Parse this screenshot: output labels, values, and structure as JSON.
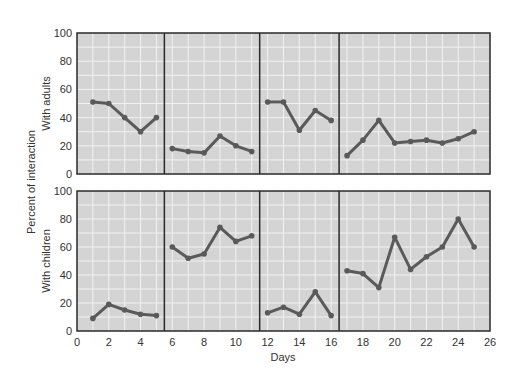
{
  "chart_data": {
    "type": "line",
    "xlabel": "Days",
    "ylabel": "Percent of interaction",
    "xlim": [
      0,
      26
    ],
    "xticks": [
      0,
      2,
      4,
      6,
      8,
      10,
      12,
      14,
      16,
      18,
      20,
      22,
      24,
      26
    ],
    "ylim": [
      0,
      100
    ],
    "yticks": [
      0,
      20,
      40,
      60,
      80,
      100
    ],
    "grid": true,
    "phase_boundaries": [
      5.5,
      11.5,
      16.5
    ],
    "colors": {
      "line": "#5a5a5a",
      "panel_bg": "#d4d4d4",
      "grid": "#f2f2f2",
      "frame": "#2a2a2a"
    },
    "panels": [
      {
        "name": "With adults",
        "segments": [
          {
            "x": [
              1,
              2,
              3,
              4,
              5
            ],
            "y": [
              51,
              50,
              40,
              30,
              40
            ]
          },
          {
            "x": [
              6,
              7,
              8,
              9,
              10,
              11
            ],
            "y": [
              18,
              16,
              15,
              27,
              20,
              16
            ]
          },
          {
            "x": [
              12,
              13,
              14,
              15,
              16
            ],
            "y": [
              51,
              51,
              31,
              45,
              38
            ]
          },
          {
            "x": [
              17,
              18,
              19,
              20,
              21,
              22,
              23,
              24,
              25
            ],
            "y": [
              13,
              24,
              38,
              22,
              23,
              24,
              22,
              25,
              30
            ]
          }
        ]
      },
      {
        "name": "With children",
        "segments": [
          {
            "x": [
              1,
              2,
              3,
              4,
              5
            ],
            "y": [
              9,
              19,
              15,
              12,
              11
            ]
          },
          {
            "x": [
              6,
              7,
              8,
              9,
              10,
              11
            ],
            "y": [
              60,
              52,
              55,
              74,
              64,
              68
            ]
          },
          {
            "x": [
              12,
              13,
              14,
              15,
              16
            ],
            "y": [
              13,
              17,
              12,
              28,
              11
            ]
          },
          {
            "x": [
              17,
              18,
              19,
              20,
              21,
              22,
              23,
              24,
              25
            ],
            "y": [
              43,
              41,
              31,
              67,
              44,
              53,
              60,
              80,
              60
            ]
          }
        ]
      }
    ]
  }
}
